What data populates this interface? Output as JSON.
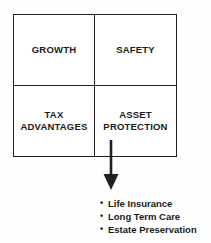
{
  "diagram": {
    "type": "quadrant-with-outcomes",
    "colors": {
      "line": "#231f20",
      "text": "#1a1a1a",
      "background": "#ffffff"
    },
    "matrix": {
      "cells": [
        {
          "id": "growth",
          "label": "GROWTH"
        },
        {
          "id": "safety",
          "label": "SAFETY"
        },
        {
          "id": "tax-advantages",
          "label": "TAX\nADVANTAGES"
        },
        {
          "id": "asset-protection",
          "label": "ASSET\nPROTECTION"
        }
      ]
    },
    "connector": {
      "icon": "down-arrow-icon",
      "direction": "down",
      "from": "asset-protection",
      "to": "outcomes"
    },
    "outcomes": {
      "bullet_glyph": "•",
      "items": [
        {
          "label": "Life Insurance"
        },
        {
          "label": "Long Term Care"
        },
        {
          "label": "Estate Preservation"
        }
      ]
    }
  }
}
